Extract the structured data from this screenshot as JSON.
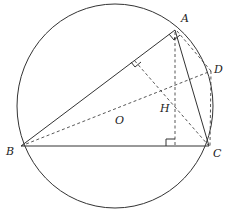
{
  "diagram": {
    "title": "",
    "labels": {
      "A": "A",
      "B": "B",
      "C": "C",
      "D": "D",
      "H": "H",
      "O": "O"
    },
    "points": {
      "A": [
        175,
        30
      ],
      "B": [
        21,
        146
      ],
      "C": [
        209,
        146
      ],
      "D": [
        211,
        71
      ],
      "H": [
        174,
        100
      ],
      "O": [
        115,
        106
      ],
      "foot_A_on_BC": [
        174,
        146
      ],
      "foot_C_on_AB": [
        133,
        60
      ]
    },
    "circle": {
      "cx": 115,
      "cy": 106,
      "r": 98
    },
    "solid_segments": [
      [
        "A",
        "B"
      ],
      [
        "B",
        "C"
      ],
      [
        "A",
        "C"
      ]
    ],
    "dashed_segments": [
      [
        "B",
        "D"
      ],
      [
        "A",
        "foot_A_on_BC"
      ],
      [
        "C",
        "foot_C_on_AB"
      ],
      [
        "A",
        "D"
      ],
      [
        "D",
        "C"
      ]
    ],
    "right_angle_marks": [
      "A",
      "foot_A_on_BC",
      "foot_C_on_AB"
    ]
  }
}
